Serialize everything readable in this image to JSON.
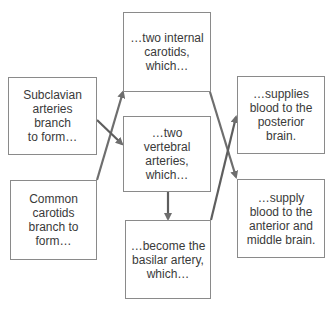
{
  "diagram": {
    "type": "flowchart",
    "colors": {
      "box_border": "#8a8a8a",
      "text": "#3a3a3a",
      "arrow": "#6e6e6e",
      "background": "#ffffff"
    },
    "boxes": [
      {
        "id": "internal_carotids",
        "text": "…two internal\ncarotids,\nwhich…"
      },
      {
        "id": "subclavian",
        "text": "Subclavian\narteries branch\nto form…"
      },
      {
        "id": "vertebral",
        "text": "…two\nvertebral\narteries,\nwhich…"
      },
      {
        "id": "common_carotids",
        "text": "Common\ncarotids\nbranch to\nform…"
      },
      {
        "id": "basilar",
        "text": "…become the\nbasilar artery,\nwhich…"
      },
      {
        "id": "posterior_brain",
        "text": "…supplies\nblood to the\nposterior\nbrain."
      },
      {
        "id": "anterior_middle_brain",
        "text": "…supply\nblood to the\nanterior and\nmiddle brain."
      }
    ],
    "edges": [
      {
        "from": "common_carotids",
        "to": "internal_carotids"
      },
      {
        "from": "subclavian",
        "to": "vertebral"
      },
      {
        "from": "vertebral",
        "to": "basilar"
      },
      {
        "from": "internal_carotids",
        "to": "anterior_middle_brain"
      },
      {
        "from": "basilar",
        "to": "posterior_brain"
      }
    ]
  }
}
